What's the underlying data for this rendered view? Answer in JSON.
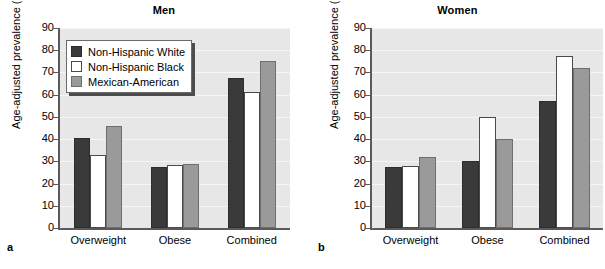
{
  "figure": {
    "panels": [
      {
        "letter": "a",
        "title": "Men",
        "ylabel": "Age-adjusted prevalence (%)"
      },
      {
        "letter": "b",
        "title": "Women",
        "ylabel": "Age-adjusted prevalence (%)"
      }
    ],
    "legend": {
      "items": [
        {
          "label": "Non-Hispanic White",
          "color": "#3a3a3a"
        },
        {
          "label": "Non-Hispanic Black",
          "color": "#ffffff"
        },
        {
          "label": "Mexican-American",
          "color": "#9a9a9a"
        }
      ]
    },
    "yticks": [
      "0",
      "10",
      "20",
      "30",
      "40",
      "50",
      "60",
      "70",
      "80",
      "90"
    ],
    "colors": {
      "series_white": "#3a3a3a",
      "series_black": "#ffffff",
      "series_mexican": "#9a9a9a",
      "plot_background": "#e7e7e7",
      "gridline": "#f6f6f6",
      "axis": "#5a5a5a"
    }
  },
  "chart_data": [
    {
      "type": "bar",
      "title": "Men",
      "panel": "a",
      "xlabel": "",
      "ylabel": "Age-adjusted prevalence (%)",
      "ylim": [
        0,
        90
      ],
      "ytick_step": 10,
      "grid": true,
      "legend_position": "inside-upper-left",
      "categories": [
        "Overweight",
        "Obese",
        "Combined"
      ],
      "series": [
        {
          "name": "Non-Hispanic White",
          "values": [
            40.5,
            27.5,
            67.5
          ]
        },
        {
          "name": "Non-Hispanic Black",
          "values": [
            33.0,
            28.5,
            61.0
          ]
        },
        {
          "name": "Mexican-American",
          "values": [
            46.0,
            29.0,
            75.0
          ]
        }
      ]
    },
    {
      "type": "bar",
      "title": "Women",
      "panel": "b",
      "xlabel": "",
      "ylabel": "Age-adjusted prevalence (%)",
      "ylim": [
        0,
        90
      ],
      "ytick_step": 10,
      "grid": true,
      "legend_position": "none",
      "categories": [
        "Overweight",
        "Obese",
        "Combined"
      ],
      "series": [
        {
          "name": "Non-Hispanic White",
          "values": [
            27.5,
            30.0,
            57.0
          ]
        },
        {
          "name": "Non-Hispanic Black",
          "values": [
            28.0,
            50.0,
            77.5
          ]
        },
        {
          "name": "Mexican-American",
          "values": [
            32.0,
            40.0,
            72.0
          ]
        }
      ]
    }
  ]
}
